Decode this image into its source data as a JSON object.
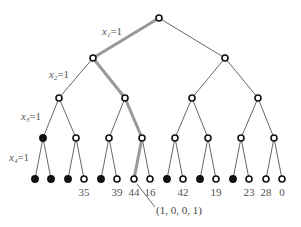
{
  "diagram": {
    "type": "binary-decision-tree",
    "levels": 4,
    "edge_labels": [
      {
        "var": "x",
        "sub": "1",
        "eq": "=1"
      },
      {
        "var": "x",
        "sub": "2",
        "eq": "=1"
      },
      {
        "var": "x",
        "sub": "3",
        "eq": "=1"
      },
      {
        "var": "x",
        "sub": "4",
        "eq": "=1"
      }
    ],
    "leaf_values": [
      "",
      "",
      "",
      "35",
      "",
      "39",
      "44",
      "16",
      "",
      "42",
      "",
      "19",
      "",
      "23",
      "28",
      "0"
    ],
    "leaf_filled": [
      true,
      true,
      true,
      false,
      true,
      false,
      false,
      false,
      true,
      false,
      true,
      false,
      true,
      false,
      false,
      false
    ],
    "level3_filled": [
      true,
      false,
      false,
      false,
      false,
      false,
      false,
      false
    ],
    "highlighted_path": [
      1,
      0,
      0,
      1
    ],
    "annotation": "(1, 0, 0, 1)",
    "colors": {
      "edge": "#555555",
      "highlight": "#999999",
      "node_stroke": "#111111"
    }
  }
}
